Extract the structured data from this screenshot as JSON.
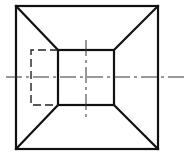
{
  "figure": {
    "type": "orthographic-top-view",
    "colors": {
      "background": "#ffffff",
      "line": "#111111"
    },
    "outer_square": {
      "x1": 16,
      "y1": 6,
      "x2": 158,
      "y2": 149
    },
    "inner_square": {
      "x1": 58,
      "y1": 50,
      "x2": 114,
      "y2": 105
    },
    "hidden_rect": {
      "x1": 31,
      "y1": 50,
      "x2": 58,
      "y2": 105
    },
    "horizontal_centerline": {
      "y": 77,
      "x1": 6,
      "x2": 184
    },
    "vertical_centerline": {
      "x": 86,
      "y1": 40,
      "y2": 120
    }
  }
}
